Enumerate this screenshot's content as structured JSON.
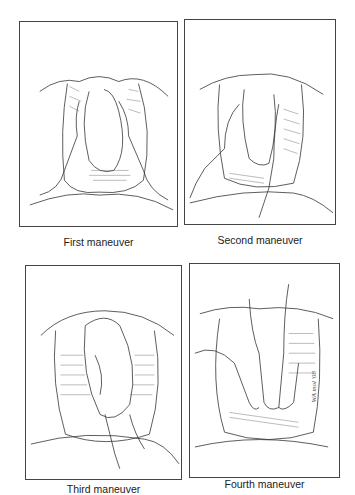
{
  "figure": {
    "panels": [
      {
        "id": "first",
        "caption": "First maneuver",
        "illustration": "hands palpating fundus of gravid abdomen"
      },
      {
        "id": "second",
        "caption": "Second maneuver",
        "illustration": "hands palpating lateral sides of gravid abdomen"
      },
      {
        "id": "third",
        "caption": "Third maneuver",
        "illustration": "single hand grasping presenting part above pubis"
      },
      {
        "id": "fourth",
        "caption": "Fourth maneuver",
        "illustration": "both hands palpating pelvic inlet facing feet",
        "signature": "WA mol '08"
      }
    ]
  }
}
